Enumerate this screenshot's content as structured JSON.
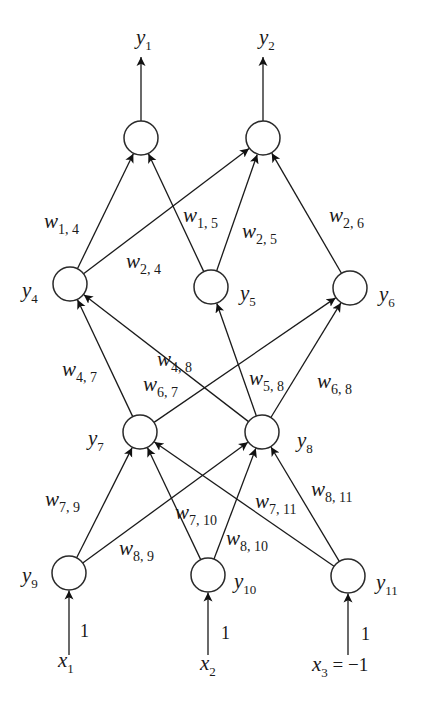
{
  "diagram": {
    "type": "feedforward-neural-network",
    "node_radius": 17,
    "colors": {
      "stroke": "#1a1a1a",
      "node_fill": "#ffffff",
      "background": "#ffffff"
    },
    "nodes": [
      {
        "id": "o1",
        "cx": 141,
        "cy": 138,
        "label": "",
        "layer": "output"
      },
      {
        "id": "o2",
        "cx": 263,
        "cy": 138,
        "label": "",
        "layer": "output"
      },
      {
        "id": "y4",
        "cx": 70,
        "cy": 284,
        "label": "4",
        "layer": "hidden-2",
        "lx": 22,
        "ly": 297
      },
      {
        "id": "y5",
        "cx": 211,
        "cy": 287,
        "label": "5",
        "layer": "hidden-2",
        "lx": 240,
        "ly": 300
      },
      {
        "id": "y6",
        "cx": 350,
        "cy": 288,
        "label": "6",
        "layer": "hidden-2",
        "lx": 379,
        "ly": 301
      },
      {
        "id": "y7",
        "cx": 140,
        "cy": 432,
        "label": "7",
        "layer": "hidden-1",
        "lx": 88,
        "ly": 445
      },
      {
        "id": "y8",
        "cx": 262,
        "cy": 432,
        "label": "8",
        "layer": "hidden-1",
        "lx": 297,
        "ly": 447
      },
      {
        "id": "y9",
        "cx": 69,
        "cy": 573,
        "label": "9",
        "layer": "input",
        "lx": 22,
        "ly": 582
      },
      {
        "id": "y10",
        "cx": 208,
        "cy": 575,
        "label": "10",
        "layer": "input",
        "lx": 234,
        "ly": 588
      },
      {
        "id": "y11",
        "cx": 348,
        "cy": 576,
        "label": "11",
        "layer": "input",
        "lx": 376,
        "ly": 589
      }
    ],
    "edges": [
      {
        "from": "y4",
        "to": "o1",
        "weight": "1, 4"
      },
      {
        "from": "y5",
        "to": "o1",
        "weight": "1, 5"
      },
      {
        "from": "y4",
        "to": "o2",
        "weight": "2, 4"
      },
      {
        "from": "y5",
        "to": "o2",
        "weight": "2, 5"
      },
      {
        "from": "y6",
        "to": "o2",
        "weight": "2, 6"
      },
      {
        "from": "y7",
        "to": "y4",
        "weight": "4, 7"
      },
      {
        "from": "y8",
        "to": "y4",
        "weight": "4, 8"
      },
      {
        "from": "y8",
        "to": "y5",
        "weight": "5, 8"
      },
      {
        "from": "y7",
        "to": "y6",
        "weight": "6, 7"
      },
      {
        "from": "y8",
        "to": "y6",
        "weight": "6, 8"
      },
      {
        "from": "y9",
        "to": "y7",
        "weight": "7, 9"
      },
      {
        "from": "y10",
        "to": "y7",
        "weight": "7, 10"
      },
      {
        "from": "y11",
        "to": "y7",
        "weight": "7, 11"
      },
      {
        "from": "y9",
        "to": "y8",
        "weight": "8, 9"
      },
      {
        "from": "y10",
        "to": "y8",
        "weight": "8, 10"
      },
      {
        "from": "y11",
        "to": "y8",
        "weight": "8, 11"
      }
    ],
    "weight_labels": [
      {
        "text": "1, 4",
        "x": 44,
        "y": 228
      },
      {
        "text": "1, 5",
        "x": 183,
        "y": 222
      },
      {
        "text": "2, 5",
        "x": 242,
        "y": 238
      },
      {
        "text": "2, 4",
        "x": 126,
        "y": 268
      },
      {
        "text": "2, 6",
        "x": 329,
        "y": 222
      },
      {
        "text": "4, 8",
        "x": 157,
        "y": 366
      },
      {
        "text": "4, 7",
        "x": 62,
        "y": 376
      },
      {
        "text": "6, 7",
        "x": 143,
        "y": 391
      },
      {
        "text": "5, 8",
        "x": 249,
        "y": 385
      },
      {
        "text": "6, 8",
        "x": 317,
        "y": 388
      },
      {
        "text": "7, 9",
        "x": 45,
        "y": 506
      },
      {
        "text": "7, 10",
        "x": 175,
        "y": 519
      },
      {
        "text": "7, 11",
        "x": 255,
        "y": 508
      },
      {
        "text": "8, 11",
        "x": 311,
        "y": 496
      },
      {
        "text": "8, 9",
        "x": 119,
        "y": 555
      },
      {
        "text": "8, 10",
        "x": 226,
        "y": 545
      }
    ],
    "weight_symbol": "w",
    "outputs": [
      {
        "label": "y",
        "sub": "1",
        "node": "o1",
        "x": 136,
        "y": 44
      },
      {
        "label": "y",
        "sub": "2",
        "node": "o2",
        "x": 259,
        "y": 44
      }
    ],
    "inputs": [
      {
        "node": "y9",
        "weight": "1",
        "var": "x",
        "sub": "1",
        "suffix": "",
        "vx": 58,
        "vy": 667,
        "wx": 80,
        "wy": 637
      },
      {
        "node": "y10",
        "weight": "1",
        "var": "x",
        "sub": "2",
        "suffix": "",
        "vx": 200,
        "vy": 670,
        "wx": 221,
        "wy": 639
      },
      {
        "node": "y11",
        "weight": "1",
        "var": "x",
        "sub": "3",
        "suffix": " = −1",
        "vx": 312,
        "vy": 671,
        "wx": 361,
        "wy": 640
      }
    ],
    "node_symbol": "y"
  }
}
